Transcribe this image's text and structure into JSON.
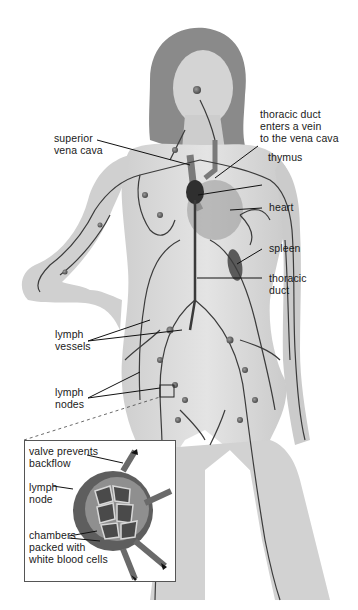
{
  "figure": {
    "labels": {
      "thoracic_duct_enters": "thoracic duct\nenters a vein\nto the vena cava",
      "superior_vena_cava": "superior\nvena cava",
      "thymus": "thymus",
      "heart": "heart",
      "spleen": "spleen",
      "thoracic_duct": "thoracic\nduct",
      "lymph_vessels": "lymph\nvessels",
      "lymph_nodes": "lymph\nnodes"
    },
    "inset": {
      "title": "Lymph node detail",
      "labels": {
        "valve": "valve prevents\nbackflow",
        "lymph_node": "lymph\nnode",
        "chambers": "chambers\npacked with\nwhite blood cells"
      }
    }
  }
}
